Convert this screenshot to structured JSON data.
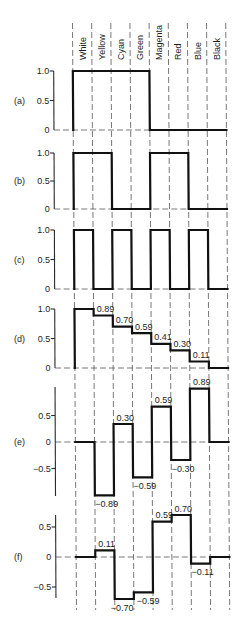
{
  "chart_data": {
    "type": "line",
    "subtype": "step",
    "title": "",
    "xlabel": "",
    "ylabel": "",
    "grid": true,
    "categories": [
      "White",
      "Yellow",
      "Cyan",
      "Green",
      "Magenta",
      "Red",
      "Blue",
      "Black"
    ],
    "series": [
      {
        "name": "(a)",
        "values": [
          1,
          1,
          1,
          1,
          0,
          0,
          0,
          0
        ],
        "ylim": [
          0,
          1.0
        ],
        "ticks": [
          {
            "value": 1.0,
            "label": "1.0"
          },
          {
            "value": 0.5,
            "label": "0.5"
          },
          {
            "value": 0,
            "label": "0"
          }
        ],
        "data_labels": []
      },
      {
        "name": "(b)",
        "values": [
          1,
          1,
          0,
          0,
          1,
          1,
          0,
          0
        ],
        "ylim": [
          0,
          1.0
        ],
        "ticks": [
          {
            "value": 1.0,
            "label": "1.0"
          },
          {
            "value": 0.5,
            "label": "0.5"
          },
          {
            "value": 0,
            "label": "0"
          }
        ],
        "data_labels": []
      },
      {
        "name": "(c)",
        "values": [
          1,
          0,
          1,
          0,
          1,
          0,
          1,
          0
        ],
        "ylim": [
          0,
          1.0
        ],
        "ticks": [
          {
            "value": 1.0,
            "label": "1.0"
          },
          {
            "value": 0.5,
            "label": "0.5"
          },
          {
            "value": 0,
            "label": "0"
          }
        ],
        "data_labels": []
      },
      {
        "name": "(d)",
        "values": [
          1.0,
          0.89,
          0.7,
          0.59,
          0.41,
          0.3,
          0.11,
          0
        ],
        "ylim": [
          0,
          1.0
        ],
        "ticks": [
          {
            "value": 1.0,
            "label": "1.0"
          },
          {
            "value": 0.5,
            "label": "0.5"
          },
          {
            "value": 0,
            "label": "0"
          }
        ],
        "data_labels": [
          {
            "index": 1,
            "text": "0.89"
          },
          {
            "index": 2,
            "text": "0.70"
          },
          {
            "index": 3,
            "text": "0.59"
          },
          {
            "index": 4,
            "text": "0.41"
          },
          {
            "index": 5,
            "text": "0.30"
          },
          {
            "index": 6,
            "text": "0.11"
          }
        ]
      },
      {
        "name": "(e)",
        "values": [
          0,
          -0.89,
          0.3,
          -0.59,
          0.59,
          -0.3,
          0.89,
          0
        ],
        "ylim": [
          -0.89,
          0.89
        ],
        "ticks": [
          {
            "value": 0.5,
            "label": "0.5"
          },
          {
            "value": 0,
            "label": "0"
          },
          {
            "value": -0.5,
            "label": "−0.5"
          }
        ],
        "data_labels": [
          {
            "index": 1,
            "text": "−0.89"
          },
          {
            "index": 2,
            "text": "0.30"
          },
          {
            "index": 3,
            "text": "−0.59"
          },
          {
            "index": 4,
            "text": "0.59"
          },
          {
            "index": 5,
            "text": "−0.30"
          },
          {
            "index": 6,
            "text": "0.89"
          }
        ]
      },
      {
        "name": "(f)",
        "values": [
          0,
          0.11,
          -0.7,
          -0.59,
          0.59,
          0.7,
          -0.11,
          0
        ],
        "ylim": [
          -0.7,
          0.7
        ],
        "ticks": [
          {
            "value": 0.5,
            "label": "0.5"
          },
          {
            "value": 0,
            "label": "0"
          },
          {
            "value": -0.5,
            "label": "−0.5"
          }
        ],
        "data_labels": [
          {
            "index": 1,
            "text": "0.11"
          },
          {
            "index": 2,
            "text": "−0.70"
          },
          {
            "index": 3,
            "text": "−0.59"
          },
          {
            "index": 4,
            "text": "0.59"
          },
          {
            "index": 5,
            "text": "0.70"
          },
          {
            "index": 6,
            "text": "−0.11"
          }
        ]
      }
    ]
  },
  "colors": {
    "trace": "#111111",
    "grid": "#555555",
    "text": "#1e1e1e",
    "background": "#ffffff"
  }
}
